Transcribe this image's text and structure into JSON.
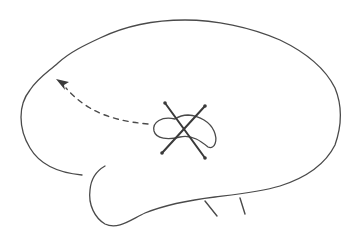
{
  "figure": {
    "type": "hand-drawn sketch",
    "elements": [
      {
        "name": "brain-outline",
        "description": "lateral brain contour with temporal lobe notch"
      },
      {
        "name": "dashed-arrow",
        "description": "dashed curved arrow pointing toward frontal region"
      },
      {
        "name": "lesion-loop",
        "description": "small looped structure in central region"
      },
      {
        "name": "cross-mark",
        "description": "X drawn over the looped structure"
      },
      {
        "name": "brainstem-ticks",
        "description": "two short strokes beneath the lower contour"
      }
    ],
    "colors": {
      "background": "#ffffff",
      "ink": "#4a4a4a",
      "ink_dark": "#3a3a3a"
    }
  }
}
